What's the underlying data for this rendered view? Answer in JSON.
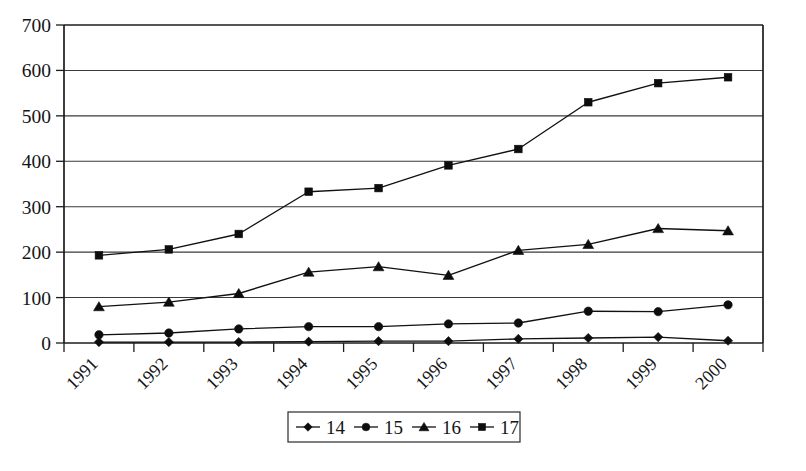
{
  "chart_data": {
    "type": "line",
    "title": "",
    "subtitle": "",
    "xlabel": "",
    "ylabel": "",
    "categories": [
      "1991",
      "1992",
      "1993",
      "1994",
      "1995",
      "1996",
      "1997",
      "1998",
      "1999",
      "2000"
    ],
    "ylim": [
      0,
      700
    ],
    "yticks": [
      0,
      100,
      200,
      300,
      400,
      500,
      600,
      700
    ],
    "ytick_labels": [
      "0",
      "100",
      "200",
      "300",
      "400",
      "500",
      "600",
      "700"
    ],
    "grid": true,
    "grid_axis": "y",
    "legend_position": "bottom",
    "xtick_label_rotation": 45,
    "series": [
      {
        "name": "14",
        "marker": "diamond",
        "values": [
          2,
          2,
          2,
          3,
          4,
          4,
          9,
          11,
          13,
          5
        ]
      },
      {
        "name": "15",
        "marker": "circle",
        "values": [
          18,
          22,
          31,
          36,
          36,
          42,
          44,
          70,
          69,
          84
        ]
      },
      {
        "name": "16",
        "marker": "triangle",
        "values": [
          80,
          90,
          109,
          156,
          168,
          149,
          204,
          217,
          252,
          247
        ]
      },
      {
        "name": "17",
        "marker": "square",
        "values": [
          193,
          206,
          240,
          333,
          341,
          391,
          427,
          530,
          572,
          585
        ]
      }
    ]
  },
  "legend": {
    "entries": [
      {
        "label": "14",
        "marker": "diamond"
      },
      {
        "label": "15",
        "marker": "circle"
      },
      {
        "label": "16",
        "marker": "triangle"
      },
      {
        "label": "17",
        "marker": "square"
      }
    ]
  }
}
